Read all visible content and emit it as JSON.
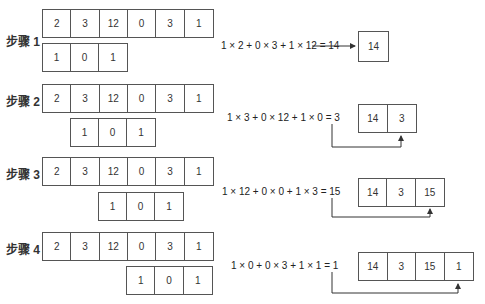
{
  "input_sequence": [
    "2",
    "3",
    "12",
    "0",
    "3",
    "1"
  ],
  "kernel": [
    "1",
    "0",
    "1"
  ],
  "steps": [
    {
      "label": "步骤 1",
      "equation": "1 × 2 + 0 × 3 + 1 × 12 = 14",
      "output": [
        "14"
      ]
    },
    {
      "label": "步骤 2",
      "equation": "1 × 3 + 0 × 12 + 1 × 0 = 3",
      "output": [
        "14",
        "3"
      ]
    },
    {
      "label": "步骤 3",
      "equation": "1 × 12 + 0 × 0 + 1 × 3 = 15",
      "output": [
        "14",
        "3",
        "15"
      ]
    },
    {
      "label": "步骤 4",
      "equation": "1 × 0 + 0 × 3 + 1 × 1 = 1",
      "output": [
        "14",
        "3",
        "15",
        "1"
      ]
    }
  ]
}
